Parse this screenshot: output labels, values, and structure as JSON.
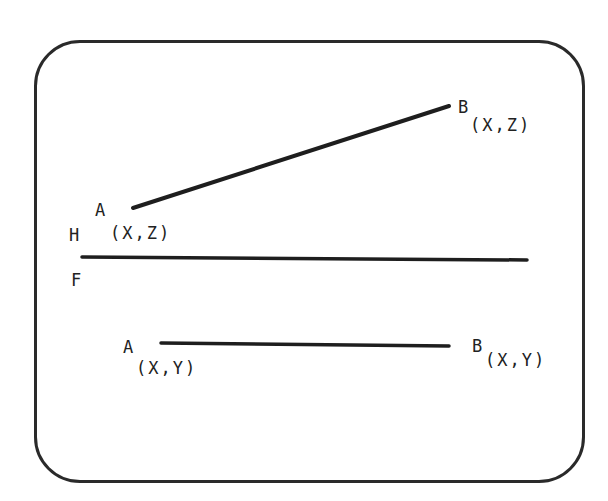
{
  "diagram": {
    "title": "",
    "frame": {
      "shape": "rounded-rectangle"
    },
    "reference_line": {
      "label_top": "H",
      "label_bottom": "F"
    },
    "upper_view": {
      "point_a": {
        "label": "A",
        "subscript": "(X,Z)"
      },
      "point_b": {
        "label": "B",
        "subscript": "(X,Z)"
      }
    },
    "lower_view": {
      "point_a": {
        "label": "A",
        "subscript": "(X,Y)"
      },
      "point_b": {
        "label": "B",
        "subscript": "(X,Y)"
      }
    },
    "colors": {
      "line": "#1e1e1e",
      "frame": "#2a2a2a",
      "background": "#ffffff"
    }
  }
}
